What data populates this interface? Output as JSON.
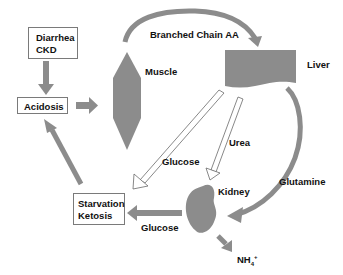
{
  "diagram": {
    "colors": {
      "shape_fill": "#8c8c8c",
      "arrow_fill": "#8c8c8c",
      "outline": "#6a6a6a",
      "hollow_arrow_fill": "#ffffff",
      "text": "#111111",
      "background": "#ffffff"
    },
    "nodes": {
      "diarrhea_ckd": {
        "lines": [
          "Diarrhea",
          "CKD"
        ]
      },
      "acidosis": {
        "label": "Acidosis"
      },
      "starvation_ketosis": {
        "lines": [
          "Starvation",
          "Ketosis"
        ]
      },
      "muscle": {
        "label": "Muscle"
      },
      "liver": {
        "label": "Liver"
      },
      "kidney": {
        "label": "Kidney"
      },
      "nh4": {
        "base": "NH",
        "sub": "4",
        "sup": "+"
      }
    },
    "edge_labels": {
      "branched_chain_aa": "Branched Chain AA",
      "glucose_liver": "Glucose",
      "urea": "Urea",
      "glutamine": "Glutamine",
      "glucose_kidney": "Glucose"
    },
    "edges": [
      {
        "from": "Diarrhea CKD",
        "to": "Acidosis",
        "style": "solid"
      },
      {
        "from": "Acidosis",
        "to": "Muscle",
        "style": "solid"
      },
      {
        "from": "Muscle",
        "to": "Liver",
        "label": "Branched Chain AA",
        "style": "curved"
      },
      {
        "from": "Liver",
        "to": "Starvation Ketosis",
        "label": "Glucose",
        "style": "hollow"
      },
      {
        "from": "Liver",
        "to": "Kidney",
        "label": "Urea",
        "style": "hollow"
      },
      {
        "from": "Liver",
        "to": "Kidney",
        "label": "Glutamine",
        "style": "curved"
      },
      {
        "from": "Kidney",
        "to": "Starvation Ketosis",
        "label": "Glucose",
        "style": "solid"
      },
      {
        "from": "Kidney",
        "to": "NH4+",
        "style": "solid"
      },
      {
        "from": "Starvation Ketosis",
        "to": "Acidosis",
        "style": "solid"
      }
    ]
  }
}
